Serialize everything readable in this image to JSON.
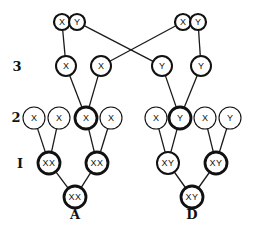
{
  "diagram": {
    "row_labels": [
      {
        "id": "3",
        "text": "3",
        "x": 17,
        "y": 71
      },
      {
        "id": "2",
        "text": "2",
        "x": 16,
        "y": 122
      },
      {
        "id": "1",
        "text": "I",
        "x": 20,
        "y": 168
      }
    ],
    "subject_labels": [
      {
        "id": "A",
        "text": "A",
        "x": 75,
        "y": 219
      },
      {
        "id": "D",
        "text": "D",
        "x": 192,
        "y": 219
      }
    ],
    "top_pairs": [
      {
        "id": "pair-left",
        "cells": [
          {
            "text": "X",
            "x": 62,
            "y": 22
          },
          {
            "text": "Y",
            "x": 77,
            "y": 22
          }
        ]
      },
      {
        "id": "pair-right",
        "cells": [
          {
            "text": "X",
            "x": 183,
            "y": 22
          },
          {
            "text": "Y",
            "x": 198,
            "y": 22
          }
        ]
      }
    ],
    "nodes": [
      {
        "id": "g3a",
        "text": "X",
        "x": 66,
        "y": 66,
        "r": 10,
        "weight": "medium"
      },
      {
        "id": "g3b",
        "text": "X",
        "x": 101,
        "y": 66,
        "r": 10,
        "weight": "medium"
      },
      {
        "id": "g3c",
        "text": "Y",
        "x": 162,
        "y": 66,
        "r": 10,
        "weight": "medium"
      },
      {
        "id": "g3d",
        "text": "Y",
        "x": 201,
        "y": 66,
        "r": 10,
        "weight": "medium"
      },
      {
        "id": "g2a",
        "text": "X",
        "x": 34,
        "y": 118,
        "r": 11,
        "weight": "thin"
      },
      {
        "id": "g2b",
        "text": "X",
        "x": 59,
        "y": 118,
        "r": 11,
        "weight": "thin"
      },
      {
        "id": "g2c",
        "text": "X",
        "x": 86,
        "y": 118,
        "r": 11,
        "weight": "thick"
      },
      {
        "id": "g2d",
        "text": "X",
        "x": 111,
        "y": 118,
        "r": 11,
        "weight": "thin"
      },
      {
        "id": "g2e",
        "text": "X",
        "x": 156,
        "y": 118,
        "r": 11,
        "weight": "thin"
      },
      {
        "id": "g2f",
        "text": "Y",
        "x": 180,
        "y": 118,
        "r": 11,
        "weight": "thick"
      },
      {
        "id": "g2g",
        "text": "X",
        "x": 205,
        "y": 118,
        "r": 11,
        "weight": "thin"
      },
      {
        "id": "g2h",
        "text": "Y",
        "x": 230,
        "y": 118,
        "r": 11,
        "weight": "thin"
      },
      {
        "id": "g1a",
        "text": "XX",
        "x": 49,
        "y": 163,
        "r": 11,
        "weight": "thick"
      },
      {
        "id": "g1b",
        "text": "XX",
        "x": 97,
        "y": 163,
        "r": 11,
        "weight": "thick"
      },
      {
        "id": "g1c",
        "text": "XY",
        "x": 168,
        "y": 163,
        "r": 11,
        "weight": "medium"
      },
      {
        "id": "g1d",
        "text": "XY",
        "x": 216,
        "y": 163,
        "r": 11,
        "weight": "thick"
      },
      {
        "id": "subjA",
        "text": "XX",
        "x": 75,
        "y": 197,
        "r": 11,
        "weight": "thick"
      },
      {
        "id": "subjD",
        "text": "XY",
        "x": 192,
        "y": 197,
        "r": 11,
        "weight": "thick"
      }
    ],
    "edges": [
      {
        "from": [
          62,
          22
        ],
        "to": "g3a"
      },
      {
        "from": [
          77,
          22
        ],
        "to": "g3c"
      },
      {
        "from": [
          183,
          22
        ],
        "to": "g3b"
      },
      {
        "from": [
          198,
          22
        ],
        "to": "g3d"
      },
      {
        "from": "g3a",
        "to": "g2c"
      },
      {
        "from": "g3b",
        "to": "g2c"
      },
      {
        "from": "g3c",
        "to": "g2f"
      },
      {
        "from": "g3d",
        "to": "g2f"
      },
      {
        "from": "g2a",
        "to": "g1a"
      },
      {
        "from": "g2b",
        "to": "g1a"
      },
      {
        "from": "g2c",
        "to": "g1b"
      },
      {
        "from": "g2d",
        "to": "g1b"
      },
      {
        "from": "g2e",
        "to": "g1c"
      },
      {
        "from": "g2f",
        "to": "g1c"
      },
      {
        "from": "g2g",
        "to": "g1d"
      },
      {
        "from": "g2h",
        "to": "g1d"
      },
      {
        "from": "g1a",
        "to": "subjA"
      },
      {
        "from": "g1b",
        "to": "subjA"
      },
      {
        "from": "g1c",
        "to": "subjD"
      },
      {
        "from": "g1d",
        "to": "subjD"
      }
    ],
    "colors": {
      "ink": "#111111",
      "background": "#ffffff"
    }
  }
}
